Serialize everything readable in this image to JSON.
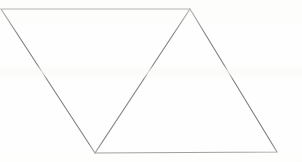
{
  "figure": {
    "background_color": "#fefefe",
    "stroke_color": "#808080",
    "stroke_width": 1.1,
    "canvas": {
      "width": 302,
      "height": 162
    },
    "vertices": {
      "top_left": {
        "label": "top-left vertex",
        "x": 1,
        "y": 9
      },
      "apex": {
        "label": "apex vertex",
        "x": 190,
        "y": 9
      },
      "bottom_left": {
        "label": "bottom-left vertex",
        "x": 95,
        "y": 153
      },
      "bottom_right": {
        "label": "bottom-right vertex",
        "x": 277,
        "y": 152
      }
    },
    "edges": [
      {
        "name": "top-edge",
        "points": "1,9 190,9"
      },
      {
        "name": "left-edge",
        "points": "1,9 95,153"
      },
      {
        "name": "bottom-edge",
        "points": "95,153 277,152"
      },
      {
        "name": "right-edge",
        "points": "190,9 277,152"
      },
      {
        "name": "interior-diagonal",
        "points": "95,153 190,9"
      }
    ],
    "outline_points": "1,9 190,9 277,152 95,153",
    "diagonal_points": "95,153 190,9",
    "left_triangle_points": "1,9 190,9 95,153",
    "right_triangle_points": "95,153 190,9 277,152"
  }
}
